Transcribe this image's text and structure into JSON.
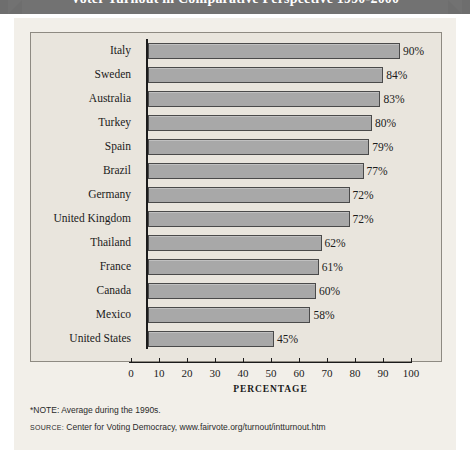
{
  "chart_title": "Voter Turnout in Comparative Perspective 1990-2000",
  "chart_data": {
    "type": "bar",
    "orientation": "horizontal",
    "title": "Voter Turnout in Comparative Perspective 1990-2000",
    "xlabel": "PERCENTAGE",
    "ylabel": "",
    "xlim": [
      0,
      100
    ],
    "xticks": [
      0,
      10,
      20,
      30,
      40,
      50,
      60,
      70,
      80,
      90,
      100
    ],
    "grid": false,
    "legend": "none",
    "categories": [
      "Italy",
      "Sweden",
      "Australia",
      "Turkey",
      "Spain",
      "Brazil",
      "Germany",
      "United Kingdom",
      "Thailand",
      "France",
      "Canada",
      "Mexico",
      "United States"
    ],
    "values": [
      90,
      84,
      83,
      80,
      79,
      77,
      72,
      72,
      62,
      61,
      60,
      58,
      45
    ],
    "value_labels": [
      "90%",
      "84%",
      "83%",
      "80%",
      "79%",
      "77%",
      "72%",
      "72%",
      "62%",
      "61%",
      "60%",
      "58%",
      "45%"
    ],
    "bar_color": "#a8a8a8",
    "bar_edge_color": "#4a4a4a",
    "panel_color": "#e9e5dd",
    "figure_color": "#f2efe9"
  },
  "footnotes": {
    "note": "*NOTE: Average during the 1990s.",
    "source_tag": "SOURCE:",
    "source_text": " Center for Voting Democracy, www.fairvote.org/turnout/intturnout.htm"
  }
}
